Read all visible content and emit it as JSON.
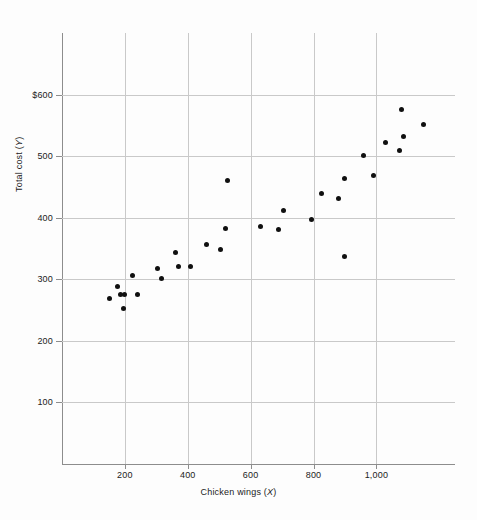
{
  "chart_data": {
    "type": "scatter",
    "title": "",
    "xlabel": "Chicken wings (X)",
    "ylabel": "Total cost (Y)",
    "xlabel_text": "Chicken wings",
    "xlabel_var": "X",
    "ylabel_text": "Total cost",
    "ylabel_var": "Y",
    "xlim": [
      0,
      1250
    ],
    "ylim": [
      0,
      700
    ],
    "grid": true,
    "legend": null,
    "xticks": [
      200,
      400,
      600,
      800,
      1000
    ],
    "xtick_labels": [
      "200",
      "400",
      "600",
      "800",
      "1,000"
    ],
    "yticks": [
      100,
      200,
      300,
      400,
      500,
      600
    ],
    "ytick_labels": [
      "100",
      "200",
      "300",
      "400",
      "500",
      "$600"
    ],
    "x": [
      150,
      175,
      185,
      195,
      200,
      225,
      240,
      305,
      315,
      360,
      370,
      410,
      460,
      505,
      520,
      525,
      630,
      690,
      705,
      795,
      825,
      880,
      900,
      900,
      960,
      990,
      1030,
      1075,
      1080,
      1085,
      1150
    ],
    "y": [
      268,
      289,
      276,
      252,
      276,
      306,
      276,
      317,
      301,
      344,
      321,
      321,
      357,
      349,
      382,
      461,
      386,
      381,
      411,
      397,
      440,
      431,
      337,
      464,
      501,
      469,
      522,
      509,
      575,
      532,
      552
    ],
    "points": [
      {
        "x": 150,
        "y": 268
      },
      {
        "x": 175,
        "y": 289
      },
      {
        "x": 185,
        "y": 276
      },
      {
        "x": 195,
        "y": 252
      },
      {
        "x": 200,
        "y": 276
      },
      {
        "x": 225,
        "y": 306
      },
      {
        "x": 240,
        "y": 276
      },
      {
        "x": 305,
        "y": 317
      },
      {
        "x": 315,
        "y": 301
      },
      {
        "x": 360,
        "y": 344
      },
      {
        "x": 370,
        "y": 321
      },
      {
        "x": 410,
        "y": 321
      },
      {
        "x": 460,
        "y": 357
      },
      {
        "x": 505,
        "y": 349
      },
      {
        "x": 520,
        "y": 382
      },
      {
        "x": 525,
        "y": 461
      },
      {
        "x": 630,
        "y": 386
      },
      {
        "x": 690,
        "y": 381
      },
      {
        "x": 705,
        "y": 411
      },
      {
        "x": 795,
        "y": 397
      },
      {
        "x": 825,
        "y": 440
      },
      {
        "x": 880,
        "y": 431
      },
      {
        "x": 900,
        "y": 337
      },
      {
        "x": 900,
        "y": 464
      },
      {
        "x": 960,
        "y": 501
      },
      {
        "x": 990,
        "y": 469
      },
      {
        "x": 1030,
        "y": 522
      },
      {
        "x": 1075,
        "y": 509
      },
      {
        "x": 1080,
        "y": 575
      },
      {
        "x": 1085,
        "y": 532
      },
      {
        "x": 1150,
        "y": 552
      }
    ],
    "marker_color": "#101010",
    "grid_color": "#c9c9c9",
    "axis_color": "#8d8d8d",
    "background_color": "#fdfdfd"
  }
}
